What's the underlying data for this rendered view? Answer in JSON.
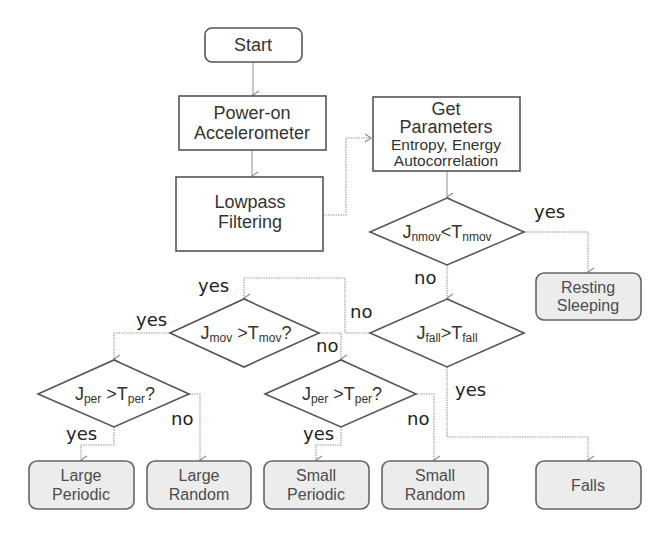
{
  "diagram": {
    "nodes": {
      "start": {
        "label": "Start",
        "shape": "rounded-rect"
      },
      "power_on": {
        "line1": "Power-on",
        "line2": "Accelerometer",
        "shape": "rect"
      },
      "lowpass": {
        "line1": "Lowpass",
        "line2": "Filtering",
        "shape": "rect"
      },
      "get_params": {
        "line1": "Get",
        "line2": "Parameters",
        "line3": "Entropy, Energy",
        "line4": "Autocorrelation",
        "shape": "rect"
      },
      "d_nmov": {
        "j": "J",
        "j_sub": "nmov",
        "op": "<",
        "t": "T",
        "t_sub": "nmov",
        "q": "",
        "shape": "diamond"
      },
      "d_fall": {
        "j": "J",
        "j_sub": "fall",
        "op": ">",
        "t": "T",
        "t_sub": "fall",
        "q": "",
        "shape": "diamond"
      },
      "d_mov": {
        "j": "J",
        "j_sub": "mov",
        "op": " >",
        "t": "T",
        "t_sub": "mov",
        "q": "?",
        "shape": "diamond"
      },
      "d_per_left": {
        "j": "J",
        "j_sub": "per",
        "op": " >",
        "t": "T",
        "t_sub": "per",
        "q": "?",
        "shape": "diamond"
      },
      "d_per_mid": {
        "j": "J",
        "j_sub": "per",
        "op": " >",
        "t": "T",
        "t_sub": "per",
        "q": "?",
        "shape": "diamond"
      },
      "resting": {
        "line1": "Resting",
        "line2": "Sleeping",
        "shape": "rounded-rect-filled"
      },
      "large_periodic": {
        "line1": "Large",
        "line2": "Periodic",
        "shape": "rounded-rect-filled"
      },
      "large_random": {
        "line1": "Large",
        "line2": "Random",
        "shape": "rounded-rect-filled"
      },
      "small_periodic": {
        "line1": "Small",
        "line2": "Periodic",
        "shape": "rounded-rect-filled"
      },
      "small_random": {
        "line1": "Small",
        "line2": "Random",
        "shape": "rounded-rect-filled"
      },
      "falls": {
        "label": "Falls",
        "shape": "rounded-rect-filled"
      }
    },
    "edge_labels": {
      "nmov_yes": "yes",
      "nmov_no": "no",
      "fall_no": "no",
      "fall_yes": "yes",
      "mov_entry_yes": "yes",
      "mov_yes": "yes",
      "mov_no": "no",
      "per_left_yes": "yes",
      "per_left_no": "no",
      "per_mid_yes": "yes",
      "per_mid_no": "no"
    },
    "edges": [
      [
        "start",
        "power_on"
      ],
      [
        "power_on",
        "lowpass"
      ],
      [
        "lowpass",
        "get_params"
      ],
      [
        "get_params",
        "d_nmov"
      ],
      [
        "d_nmov",
        "resting",
        "yes"
      ],
      [
        "d_nmov",
        "d_fall",
        "no"
      ],
      [
        "d_fall",
        "d_mov",
        "no"
      ],
      [
        "d_fall",
        "falls",
        "yes"
      ],
      [
        "d_mov",
        "d_per_left",
        "yes"
      ],
      [
        "d_mov",
        "d_per_mid",
        "no"
      ],
      [
        "d_per_left",
        "large_periodic",
        "yes"
      ],
      [
        "d_per_left",
        "large_random",
        "no"
      ],
      [
        "d_per_mid",
        "small_periodic",
        "yes"
      ],
      [
        "d_per_mid",
        "small_random",
        "no"
      ]
    ]
  }
}
